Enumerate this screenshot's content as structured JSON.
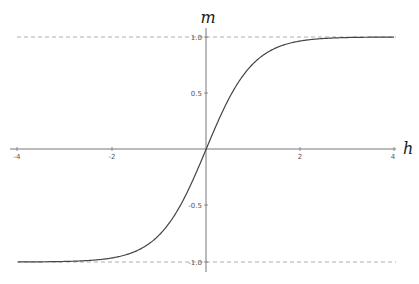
{
  "chart_data": {
    "type": "line",
    "title": "",
    "xlabel": "h",
    "ylabel": "m",
    "xlim": [
      -4,
      4
    ],
    "ylim": [
      -1.1,
      1.1
    ],
    "x_ticks": [
      "-4",
      "-2",
      "2",
      "4"
    ],
    "y_ticks": [
      "1.0",
      "0.5",
      "-0.5",
      "-1.0"
    ],
    "grid": false,
    "legend": null,
    "series": [
      {
        "name": "m = tanh(h)",
        "x": [
          -4,
          -3,
          -2.5,
          -2,
          -1.5,
          -1,
          -0.5,
          0,
          0.5,
          1,
          1.5,
          2,
          2.5,
          3,
          4
        ],
        "values": [
          -0.999,
          -0.995,
          -0.987,
          -0.964,
          -0.905,
          -0.762,
          -0.462,
          0,
          0.462,
          0.762,
          0.905,
          0.964,
          0.987,
          0.995,
          0.999
        ],
        "color": "#444444"
      }
    ],
    "asymptotes": [
      {
        "y": 1.0,
        "style": "dashed",
        "color": "#999999"
      },
      {
        "y": -1.0,
        "style": "dashed",
        "color": "#999999"
      }
    ]
  },
  "labels": {
    "x_axis": "h",
    "y_axis": "m",
    "x_tick_neg4": "-4",
    "x_tick_neg2": "-2",
    "x_tick_2": "2",
    "x_tick_4": "4",
    "y_tick_1": "1.0",
    "y_tick_05": "0.5",
    "y_tick_neg05": "-0.5",
    "y_tick_neg1": "-1.0"
  }
}
